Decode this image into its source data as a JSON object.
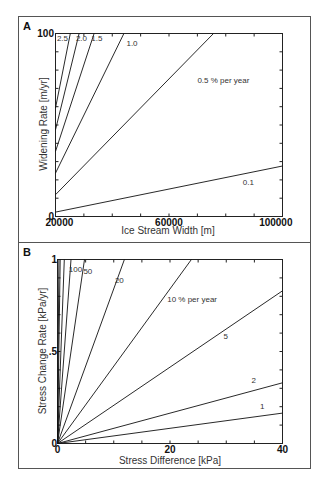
{
  "chart_data": [
    {
      "panel": "A",
      "type": "line",
      "title": "",
      "xlabel": "Ice Stream Width [m]",
      "ylabel": "Widening Rate [m/yr]",
      "xlim": [
        20000,
        100000
      ],
      "ylim": [
        0,
        100
      ],
      "xticks": [
        20000,
        30000,
        40000,
        50000,
        60000,
        70000,
        80000,
        90000,
        100000
      ],
      "xtick_labels": [
        {
          "value": 20000,
          "label": "20000"
        },
        {
          "value": 60000,
          "label": "60000"
        },
        {
          "value": 100000,
          "label": "100000"
        }
      ],
      "yticks": [
        0,
        10,
        20,
        30,
        40,
        50,
        60,
        70,
        80,
        90,
        100
      ],
      "ytick_labels": [
        {
          "value": 0,
          "label": "0"
        },
        {
          "value": 100,
          "label": "100"
        }
      ],
      "grid": false,
      "series": [
        {
          "name": "0.1",
          "rate_percent_per_year": 0.1,
          "x": [
            20000,
            100000
          ],
          "y": [
            2.4,
            27.6
          ],
          "label_pos": [
            86000,
            17
          ]
        },
        {
          "name": "0.5 % per year",
          "rate_percent_per_year": 0.5,
          "x": [
            20000,
            75700
          ],
          "y": [
            11.9,
            100
          ],
          "label_pos": [
            70000,
            73
          ]
        },
        {
          "name": "1.0",
          "rate_percent_per_year": 1.0,
          "x": [
            20000,
            44100
          ],
          "y": [
            23.7,
            100
          ],
          "label_pos": [
            45000,
            93
          ]
        },
        {
          "name": "1.5",
          "rate_percent_per_year": 1.5,
          "x": [
            20000,
            33600
          ],
          "y": [
            35.6,
            100
          ],
          "label_pos": [
            32600,
            96
          ]
        },
        {
          "name": "2.0",
          "rate_percent_per_year": 2.0,
          "x": [
            20000,
            28300
          ],
          "y": [
            47.4,
            100
          ],
          "label_pos": [
            27200,
            96
          ]
        },
        {
          "name": "2.5",
          "rate_percent_per_year": 2.5,
          "x": [
            20000,
            25200
          ],
          "y": [
            59.3,
            100
          ],
          "label_pos": [
            20500,
            96
          ]
        }
      ]
    },
    {
      "panel": "B",
      "type": "line",
      "title": "",
      "xlabel": "Stress Difference [kPa]",
      "ylabel": "Stress Change Rate [kPa/yr]",
      "xlim": [
        0,
        40
      ],
      "ylim": [
        0,
        1
      ],
      "xticks": [
        0,
        5,
        10,
        15,
        20,
        25,
        30,
        35,
        40
      ],
      "xtick_labels": [
        {
          "value": 0,
          "label": "0"
        },
        {
          "value": 20,
          "label": "20"
        },
        {
          "value": 40,
          "label": "40"
        }
      ],
      "yticks": [
        0,
        0.1,
        0.2,
        0.3,
        0.4,
        0.5,
        0.6,
        0.7,
        0.8,
        0.9,
        1
      ],
      "ytick_labels": [
        {
          "value": 0,
          "label": "0"
        },
        {
          "value": 0.5,
          "label": ".5"
        },
        {
          "value": 1,
          "label": "1"
        }
      ],
      "grid": false,
      "series": [
        {
          "name": "1",
          "rate_percent_per_year": 1,
          "x": [
            0,
            40
          ],
          "y": [
            0,
            0.165
          ],
          "label_pos": [
            36,
            0.19
          ]
        },
        {
          "name": "2",
          "rate_percent_per_year": 2,
          "x": [
            0,
            40
          ],
          "y": [
            0,
            0.33
          ],
          "label_pos": [
            34.5,
            0.33
          ]
        },
        {
          "name": "5",
          "rate_percent_per_year": 5,
          "x": [
            0,
            40
          ],
          "y": [
            0,
            0.83
          ],
          "label_pos": [
            29.5,
            0.57
          ]
        },
        {
          "name": "10 % per year",
          "rate_percent_per_year": 10,
          "x": [
            0,
            23.8
          ],
          "y": [
            0,
            1
          ],
          "label_pos": [
            19.5,
            0.77
          ]
        },
        {
          "name": "20",
          "rate_percent_per_year": 20,
          "x": [
            0,
            11.9
          ],
          "y": [
            0,
            1
          ],
          "label_pos": [
            10.2,
            0.87
          ]
        },
        {
          "name": "50",
          "rate_percent_per_year": 50,
          "x": [
            0,
            4.8
          ],
          "y": [
            0,
            1
          ],
          "label_pos": [
            4.6,
            0.92
          ]
        },
        {
          "name": "100",
          "rate_percent_per_year": 100,
          "x": [
            0,
            2.4
          ],
          "y": [
            0,
            1
          ],
          "label_pos": [
            2.0,
            0.93
          ]
        },
        {
          "name": "",
          "rate_percent_per_year": 200,
          "x": [
            0,
            1.2
          ],
          "y": [
            0,
            1
          ]
        },
        {
          "name": "",
          "rate_percent_per_year": 500,
          "x": [
            0,
            0.48
          ],
          "y": [
            0,
            1
          ]
        },
        {
          "name": "",
          "rate_percent_per_year": 1000,
          "x": [
            0,
            0.24
          ],
          "y": [
            0,
            1
          ]
        }
      ]
    }
  ],
  "figure": {
    "panel_labels": [
      "A",
      "B"
    ]
  }
}
